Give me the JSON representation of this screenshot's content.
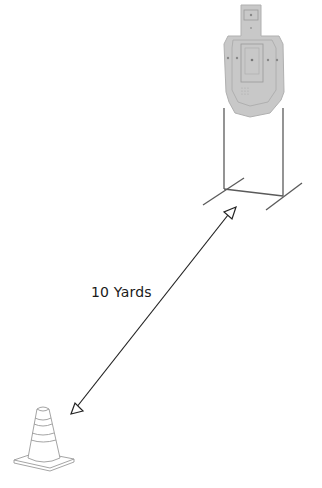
{
  "diagram": {
    "distance_label": "10 Yards",
    "elements": [
      {
        "name": "steel-target",
        "description": "IPSC-style silhouette target on stand"
      },
      {
        "name": "target-stand",
        "description": "two-post stand with crossed feet"
      },
      {
        "name": "distance-arrow",
        "description": "double-headed arrow between cone and target"
      },
      {
        "name": "traffic-cone",
        "description": "striped safety cone marking shooter position"
      }
    ],
    "colors": {
      "target_fill": "#c8c8c8",
      "target_outline": "#a0a0a0",
      "stand_line": "#555555",
      "arrow_line": "#222222",
      "cone_line": "#9a9a9a",
      "text": "#1a1a1a"
    }
  }
}
